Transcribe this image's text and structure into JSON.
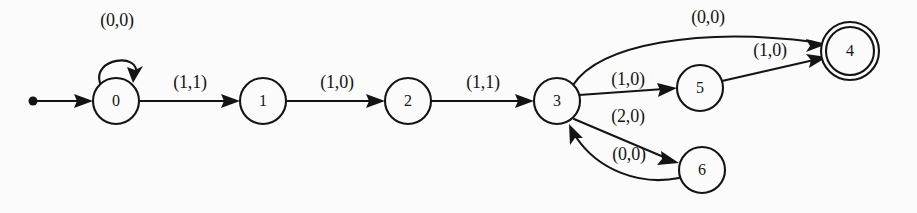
{
  "figure": {
    "kind": "finite-state-machine-diagram",
    "background_color": "#fbfbfb",
    "ink_color": "#141414",
    "width": 917,
    "height": 213
  },
  "states": [
    {
      "id": "0",
      "label": "0",
      "cx": 116,
      "cy": 101,
      "r": 23,
      "accepting": false,
      "start": true
    },
    {
      "id": "1",
      "label": "1",
      "cx": 263,
      "cy": 101,
      "r": 23,
      "accepting": false,
      "start": false
    },
    {
      "id": "2",
      "label": "2",
      "cx": 408,
      "cy": 101,
      "r": 23,
      "accepting": false,
      "start": false
    },
    {
      "id": "3",
      "label": "3",
      "cx": 557,
      "cy": 101,
      "r": 23,
      "accepting": false,
      "start": false
    },
    {
      "id": "5",
      "label": "5",
      "cx": 700,
      "cy": 88,
      "r": 23,
      "accepting": false,
      "start": false
    },
    {
      "id": "6",
      "label": "6",
      "cx": 702,
      "cy": 170,
      "r": 23,
      "accepting": false,
      "start": false
    },
    {
      "id": "4",
      "label": "4",
      "cx": 850,
      "cy": 51,
      "r": 24,
      "accepting": true,
      "start": false
    }
  ],
  "transitions": [
    {
      "from": "0",
      "to": "0",
      "label": "(0,0)",
      "label_x": 117,
      "label_y": 22,
      "shape": "self-loop"
    },
    {
      "from": "0",
      "to": "1",
      "label": "(1,1)",
      "label_x": 190,
      "label_y": 84,
      "shape": "straight"
    },
    {
      "from": "1",
      "to": "2",
      "label": "(1,0)",
      "label_x": 337,
      "label_y": 84,
      "shape": "straight"
    },
    {
      "from": "2",
      "to": "3",
      "label": "(1,1)",
      "label_x": 483,
      "label_y": 84,
      "shape": "straight"
    },
    {
      "from": "3",
      "to": "4",
      "label": "(0,0)",
      "label_x": 708,
      "label_y": 19,
      "shape": "curve-up"
    },
    {
      "from": "3",
      "to": "5",
      "label": "(1,0)",
      "label_x": 628,
      "label_y": 81,
      "shape": "straight"
    },
    {
      "from": "5",
      "to": "4",
      "label": "(1,0)",
      "label_x": 770,
      "label_y": 52,
      "shape": "straight"
    },
    {
      "from": "3",
      "to": "6",
      "label": "(2,0)",
      "label_x": 628,
      "label_y": 118,
      "shape": "straight"
    },
    {
      "from": "6",
      "to": "3",
      "label": "(0,0)",
      "label_x": 629,
      "label_y": 156,
      "shape": "curve-back"
    }
  ],
  "start_marker": {
    "name": "start-arrow",
    "dot_x": 33,
    "dot_y": 101,
    "dot_r": 4.5,
    "tip_x": 93,
    "tip_y": 101
  }
}
